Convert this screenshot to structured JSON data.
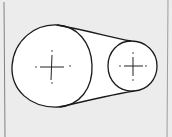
{
  "diagram": {
    "type": "belt-drive",
    "colors": {
      "background": "#ececec",
      "fill": "#ffffff",
      "stroke": "#1a1a1a",
      "frame": "#555555"
    },
    "pulleys": [
      {
        "name": "large-pulley",
        "cx": 52,
        "cy": 67,
        "r": 40
      },
      {
        "name": "small-pulley",
        "cx": 133,
        "cy": 66,
        "r": 25
      }
    ],
    "belt": {
      "top": {
        "from": [
          57,
          25
        ],
        "to": [
          131,
          41
        ]
      },
      "bottom": {
        "from": [
          60,
          107
        ],
        "to": [
          134,
          91
        ]
      }
    }
  }
}
